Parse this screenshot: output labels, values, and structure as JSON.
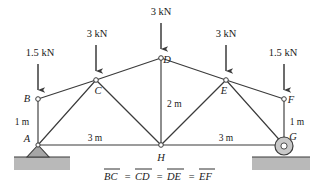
{
  "figure": {
    "caption": "BC = CD = DE = EF",
    "caption_parts": [
      "BC",
      "=",
      "CD",
      "=",
      "DE",
      "=",
      "EF"
    ],
    "colors": {
      "line": "#3b3b3b",
      "ground_fill": "#b8b8b8",
      "support_fill": "#a8a8a8",
      "node_fill": "#ffffff",
      "text": "#1a1a1a",
      "background": "#ffffff"
    }
  },
  "loads": [
    {
      "id": "load-B",
      "label": "1.5 kN",
      "label_x": 40,
      "label_y": 56,
      "arrow_x": 38,
      "arrow_top": 64,
      "arrow_bottom": 97
    },
    {
      "id": "load-C",
      "label": "3 kN",
      "label_x": 97,
      "label_y": 37,
      "arrow_x": 96,
      "arrow_top": 45,
      "arrow_bottom": 78
    },
    {
      "id": "load-D",
      "label": "3 kN",
      "label_x": 161,
      "label_y": 15,
      "arrow_x": 161,
      "arrow_top": 23,
      "arrow_bottom": 56
    },
    {
      "id": "load-E",
      "label": "3 kN",
      "label_x": 226,
      "label_y": 37,
      "arrow_x": 226,
      "arrow_top": 45,
      "arrow_bottom": 78
    },
    {
      "id": "load-F",
      "label": "1.5 kN",
      "label_x": 283,
      "label_y": 56,
      "arrow_x": 284,
      "arrow_top": 64,
      "arrow_bottom": 97
    }
  ],
  "joints": [
    {
      "id": "A",
      "label": "A",
      "x": 38,
      "y": 145,
      "label_x": 27,
      "label_y": 142,
      "marker": false
    },
    {
      "id": "B",
      "label": "B",
      "x": 38,
      "y": 99,
      "label_x": 27,
      "label_y": 102,
      "marker": true
    },
    {
      "id": "C",
      "label": "C",
      "x": 96,
      "y": 80,
      "label_x": 98,
      "label_y": 94,
      "marker": true
    },
    {
      "id": "D",
      "label": "D",
      "x": 161,
      "y": 58,
      "label_x": 166,
      "label_y": 62,
      "marker": true
    },
    {
      "id": "E",
      "label": "E",
      "x": 226,
      "y": 80,
      "label_x": 224,
      "label_y": 94,
      "marker": true
    },
    {
      "id": "F",
      "label": "F",
      "x": 284,
      "y": 99,
      "label_x": 290,
      "label_y": 103,
      "marker": true
    },
    {
      "id": "G",
      "label": "G",
      "x": 284,
      "y": 145,
      "label_x": 292,
      "label_y": 140,
      "marker": false
    },
    {
      "id": "H",
      "label": "H",
      "x": 161,
      "y": 145,
      "label_x": 158,
      "label_y": 160,
      "marker": true
    }
  ],
  "members": [
    {
      "id": "member-AB",
      "from": "A",
      "to": "B"
    },
    {
      "id": "member-BC",
      "from": "B",
      "to": "C"
    },
    {
      "id": "member-CD",
      "from": "C",
      "to": "D"
    },
    {
      "id": "member-DE",
      "from": "D",
      "to": "E"
    },
    {
      "id": "member-EF",
      "from": "E",
      "to": "F"
    },
    {
      "id": "member-FG",
      "from": "F",
      "to": "G"
    },
    {
      "id": "member-AH",
      "from": "A",
      "to": "H"
    },
    {
      "id": "member-HG",
      "from": "H",
      "to": "G"
    },
    {
      "id": "member-AC",
      "from": "A",
      "to": "C"
    },
    {
      "id": "member-CH",
      "from": "C",
      "to": "H"
    },
    {
      "id": "member-DH",
      "from": "D",
      "to": "H"
    },
    {
      "id": "member-HE",
      "from": "H",
      "to": "E"
    },
    {
      "id": "member-EG",
      "from": "E",
      "to": "G"
    }
  ],
  "dimensions": [
    {
      "id": "dim-left-height",
      "label": "1 m",
      "x": 22,
      "y": 122,
      "anchor": "middle"
    },
    {
      "id": "dim-right-height",
      "label": "1 m",
      "x": 296,
      "y": 122,
      "anchor": "middle"
    },
    {
      "id": "dim-left-span",
      "label": "3 m",
      "x": 95,
      "y": 140,
      "anchor": "middle"
    },
    {
      "id": "dim-right-span",
      "label": "3 m",
      "x": 226,
      "y": 140,
      "anchor": "middle"
    },
    {
      "id": "dim-rise",
      "label": "2 m",
      "x": 173,
      "y": 107,
      "anchor": "start"
    }
  ],
  "supports": {
    "pin": {
      "id": "pin-support",
      "x": 38,
      "y": 145,
      "half_width": 11,
      "height": 12
    },
    "roller": {
      "id": "roller-support",
      "x": 284,
      "y": 145,
      "radius": 9
    }
  },
  "ground": [
    {
      "id": "ground-left",
      "x": 14,
      "y": 157,
      "width": 56,
      "height": 13,
      "line_y": 157,
      "line_x1": 14,
      "line_x2": 70
    },
    {
      "id": "ground-right",
      "x": 252,
      "y": 157,
      "width": 58,
      "height": 13,
      "line_y": 157,
      "line_x1": 252,
      "line_x2": 310
    }
  ]
}
